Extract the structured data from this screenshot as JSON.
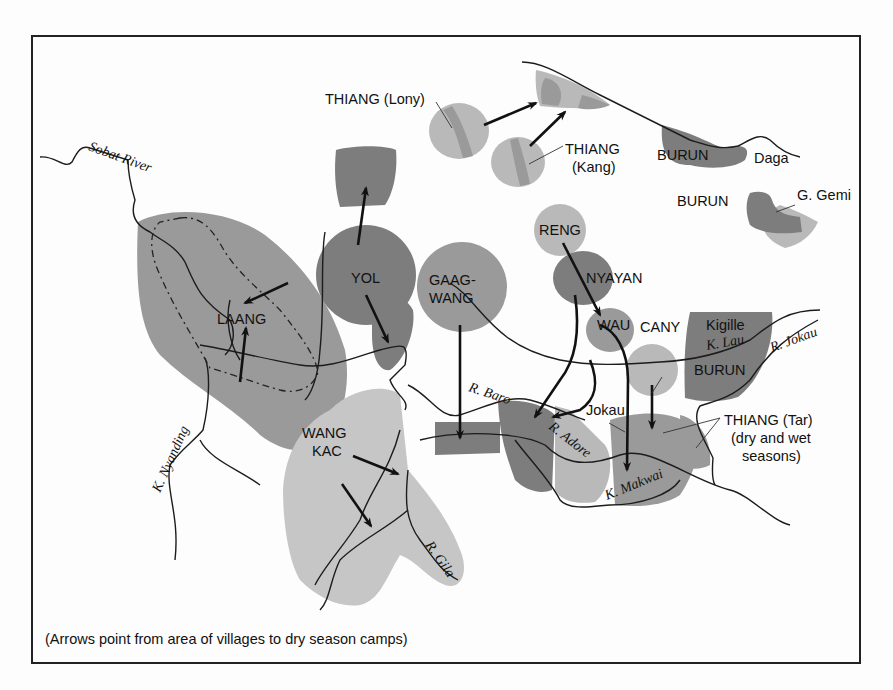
{
  "map": {
    "caption": "(Arrows point from area of villages to dry season camps)",
    "tribal_areas": {
      "thiang_lony": "THIANG (Lony)",
      "thiang_kang_1": "THIANG",
      "thiang_kang_2": "(Kang)",
      "burun_daga": "BURUN",
      "daga": "Daga",
      "burun_north": "BURUN",
      "g_gemi": "G. Gemi",
      "reng": "RENG",
      "nyayan": "NYAYAN",
      "wau": "WAU",
      "cany": "CANY",
      "kigille": "Kigille",
      "burun_east": "BURUN",
      "yol": "YOL",
      "gaagwang_1": "GAAG-",
      "gaagwang_2": "WANG",
      "laang": "LAANG",
      "wangkac_1": "WANG",
      "wangkac_2": "KAC",
      "jokau": "Jokau",
      "thiang_tar_1": "THIANG (Tar)",
      "thiang_tar_2": "(dry and wet",
      "thiang_tar_3": "seasons)"
    },
    "rivers": {
      "sobat": "Sobat River",
      "nyanding": "K. Nyanding",
      "baro": "R. Baro",
      "adore": "R. Adore",
      "makwai": "K. Makwai",
      "lau": "K. Lau",
      "jokau": "R. Jokau",
      "gila": "R. Gila"
    },
    "shades": {
      "dark": "#7d7d7d",
      "mid": "#9a9a9a",
      "light": "#b9b9b9"
    }
  }
}
